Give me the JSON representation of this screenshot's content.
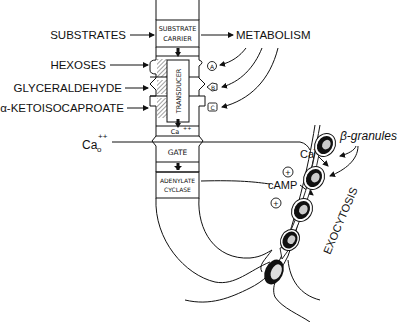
{
  "diagram": {
    "inputs": {
      "substrates": "SUBSTRATES",
      "hexoses": "HEXOSES",
      "glyceraldehyde": "GLYCERALDEHYDE",
      "ketoisocaproate": "α-KETOISOCAPROATE",
      "calcium_outside": "Ca",
      "calcium_outside_sub": "o",
      "calcium_outside_sup": "++"
    },
    "column": {
      "substrate_carrier_line1": "SUBSTRATE",
      "substrate_carrier_line2": "CARRIER",
      "transducer": "TRANSDUCER",
      "ca_inside": "Ca",
      "ca_inside_sup": "++",
      "gate": "GATE",
      "adenylate_line1": "ADENYLATE",
      "adenylate_line2": "CYCLASE"
    },
    "metabolism": {
      "label": "METABOLISM",
      "sites": [
        "A",
        "B",
        "C"
      ]
    },
    "signals": {
      "calcium": "Ca",
      "calcium_sup": "++",
      "camp": "cAMP",
      "plus": "+"
    },
    "granules": {
      "label": "β-granules",
      "exocytosis": "EXOCYTOSIS"
    },
    "colors": {
      "ink": "#111111",
      "background": "#ffffff"
    }
  }
}
